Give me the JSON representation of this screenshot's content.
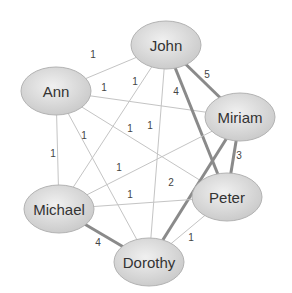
{
  "nodes": [
    {
      "id": "John",
      "label": "John",
      "cx": 166,
      "cy": 45,
      "rx": 35,
      "ry": 24
    },
    {
      "id": "Ann",
      "label": "Ann",
      "cx": 56,
      "cy": 91,
      "rx": 35,
      "ry": 24
    },
    {
      "id": "Miriam",
      "label": "Miriam",
      "cx": 240,
      "cy": 117,
      "rx": 35,
      "ry": 24
    },
    {
      "id": "Michael",
      "label": "Michael",
      "cx": 59,
      "cy": 209,
      "rx": 35,
      "ry": 24
    },
    {
      "id": "Peter",
      "label": "Peter",
      "cx": 227,
      "cy": 197,
      "rx": 35,
      "ry": 24
    },
    {
      "id": "Dorothy",
      "label": "Dorothy",
      "cx": 149,
      "cy": 262,
      "rx": 35,
      "ry": 24
    }
  ],
  "edges": [
    {
      "from": "John",
      "to": "Ann",
      "weight": "1",
      "lx": 93,
      "ly": 54
    },
    {
      "from": "Ann",
      "to": "Miriam",
      "weight": "1",
      "lx": 104,
      "ly": 87
    },
    {
      "from": "Ann",
      "to": "Peter",
      "weight": "1",
      "lx": 130,
      "ly": 128
    },
    {
      "from": "Ann",
      "to": "Michael",
      "weight": "1",
      "lx": 53,
      "ly": 153
    },
    {
      "from": "Ann",
      "to": "Dorothy",
      "weight": "1",
      "lx": 84,
      "ly": 135
    },
    {
      "from": "John",
      "to": "Michael",
      "weight": "1",
      "lx": 135,
      "ly": 81
    },
    {
      "from": "John",
      "to": "Dorothy",
      "weight": "1",
      "lx": 150,
      "ly": 125
    },
    {
      "from": "John",
      "to": "Peter",
      "weight": "4",
      "lx": 176,
      "ly": 91
    },
    {
      "from": "John",
      "to": "Miriam",
      "weight": "5",
      "lx": 207,
      "ly": 74
    },
    {
      "from": "Miriam",
      "to": "Michael",
      "weight": "1",
      "lx": 119,
      "ly": 167
    },
    {
      "from": "Miriam",
      "to": "Peter",
      "weight": "3",
      "lx": 239,
      "ly": 155
    },
    {
      "from": "Miriam",
      "to": "Dorothy",
      "weight": "2",
      "lx": 171,
      "ly": 182
    },
    {
      "from": "Michael",
      "to": "Peter",
      "weight": "1",
      "lx": 130,
      "ly": 194
    },
    {
      "from": "Michael",
      "to": "Dorothy",
      "weight": "4",
      "lx": 98,
      "ly": 242
    },
    {
      "from": "Peter",
      "to": "Dorothy",
      "weight": "1",
      "lx": 191,
      "ly": 237
    }
  ],
  "colors": {
    "node_fill_center": "#ececec",
    "node_fill_edge": "#c9c9c9",
    "node_stroke": "#b3b3b3",
    "edge_thin": "#c4c4c4",
    "edge_thick": "#8a8a8a",
    "text": "#333333"
  }
}
